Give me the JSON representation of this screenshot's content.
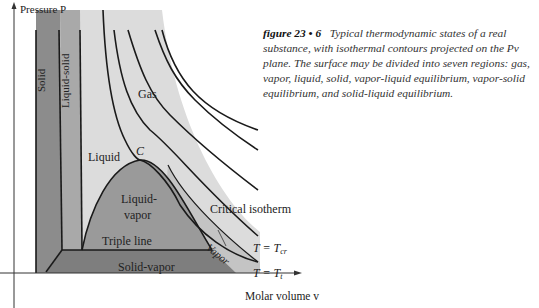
{
  "figure": {
    "number": "figure 23 • 6",
    "caption": "Typical thermodynamic states of a real substance, with isothermal contours projected on the Pv plane. The surface may be divided into seven regions: gas, vapor, liquid, solid, vapor-liquid equilibrium, vapor-solid equilibrium, and solid-liquid equilibrium."
  },
  "axes": {
    "y_label": "Pressure P",
    "x_label": "Molar volume v"
  },
  "regions": {
    "solid": "Solid",
    "liquid_solid": "Liquid-solid",
    "gas": "Gas",
    "liquid": "Liquid",
    "critical_point": "C",
    "liquid_vapor_line1": "Liquid-",
    "liquid_vapor_line2": "vapor",
    "triple_line": "Triple line",
    "solid_vapor": "Solid-vapor",
    "vapor": "Vapor"
  },
  "annotations": {
    "critical_isotherm": "Critical isotherm",
    "t_cr_prefix": "T  =  T",
    "t_cr_sub": "cr",
    "t_t_prefix": "T  =  T",
    "t_t_sub": "t"
  },
  "colors": {
    "solid": "#8c8c8c",
    "liquid_solid": "#a9a9a9",
    "liquid_gas": "#dcdcdc",
    "liquid_vapor": "#9a9a9a",
    "solid_vapor": "#7e7e7e",
    "vapor": "#c4c4c4",
    "line": "#1a1a1a"
  }
}
